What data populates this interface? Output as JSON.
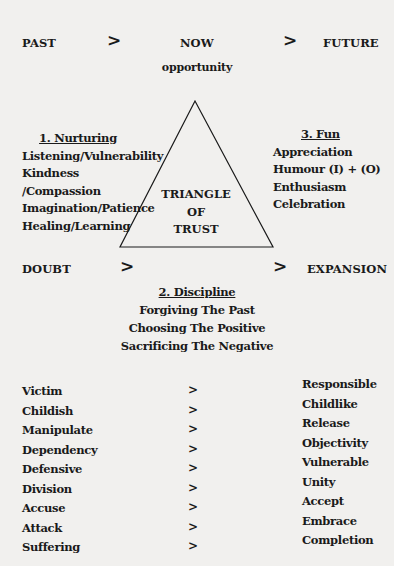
{
  "timeline_top": {
    "start": "PAST",
    "middle": "NOW",
    "end": "FUTURE",
    "arrow": ">",
    "subtitle": "opportunity"
  },
  "triangle": {
    "center_lines": [
      "TRIANGLE",
      "OF",
      "TRUST"
    ]
  },
  "nurturing": {
    "heading": "1. Nurturing",
    "items": [
      "Listening/Vulnerability",
      "Kindness /Compassion",
      "Imagination/Patience",
      "Healing/Learning"
    ]
  },
  "fun": {
    "heading": "3. Fun",
    "items": [
      "Appreciation",
      "Humour (I) + (O)",
      "Enthusiasm",
      "Celebration"
    ]
  },
  "timeline_bottom": {
    "start": "DOUBT",
    "end": "EXPANSION",
    "arrow": ">"
  },
  "discipline": {
    "heading": "2. Discipline",
    "items": [
      "Forgiving The Past",
      "Choosing The Positive",
      "Sacrificing The Negative"
    ]
  },
  "transformations": {
    "arrow": ">",
    "from": [
      "Victim",
      "Childish",
      "Manipulate",
      "Dependency",
      "Defensive",
      "Division",
      "Accuse",
      "Attack",
      "Suffering"
    ],
    "to": [
      "Responsible",
      "Childlike",
      "Release",
      "Objectivity",
      "Vulnerable",
      "Unity",
      "Accept",
      "Embrace",
      "Completion"
    ]
  }
}
